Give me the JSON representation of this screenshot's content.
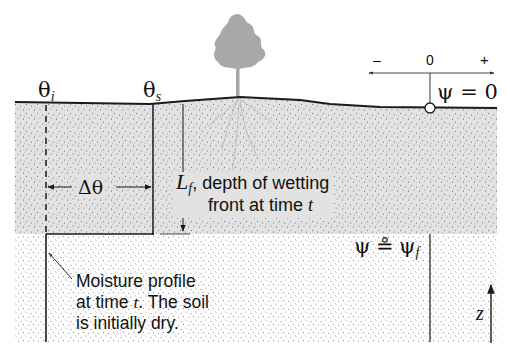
{
  "diagram": {
    "type": "soil-infiltration-wetting-front",
    "labels": {
      "theta_i": {
        "symbol": "θ",
        "subscript": "i"
      },
      "theta_s": {
        "symbol": "θ",
        "subscript": "s"
      },
      "delta_theta": "Δθ",
      "lf_symbol": "L",
      "lf_subscript": "f",
      "lf_text_line1": ", depth of wetting",
      "lf_text_line2_prefix": "front at time ",
      "lf_text_line2_var": "t",
      "psi_surface": "ψ = 0",
      "psi_front_lhs": "ψ",
      "psi_front_op": "≗",
      "psi_front_rhs": "ψ",
      "psi_front_sub": "f",
      "moisture_line1": "Moisture profile",
      "moisture_line2_prefix": "at time ",
      "moisture_line2_var": "t",
      "moisture_line2_suffix": ". The soil",
      "moisture_line3": "is initially dry.",
      "z_axis": "z",
      "pressure_axis": {
        "minus": "–",
        "zero": "0",
        "plus": "+"
      }
    },
    "colors": {
      "wet_zone": "#e2e2e2",
      "dry_zone": "#ffffff",
      "stipple": "#555555",
      "lines": "#1a1a1a",
      "tree": "#a8a8a8"
    }
  }
}
